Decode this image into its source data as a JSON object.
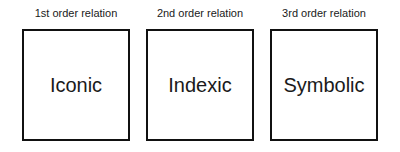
{
  "diagram": {
    "panels": [
      {
        "label": "1st order relation",
        "term": "Iconic"
      },
      {
        "label": "2nd order relation",
        "term": "Indexic"
      },
      {
        "label": "3rd order relation",
        "term": "Symbolic"
      }
    ]
  },
  "colors": {
    "background": "#ffffff",
    "border": "#111111",
    "text": "#1a1a1a"
  }
}
